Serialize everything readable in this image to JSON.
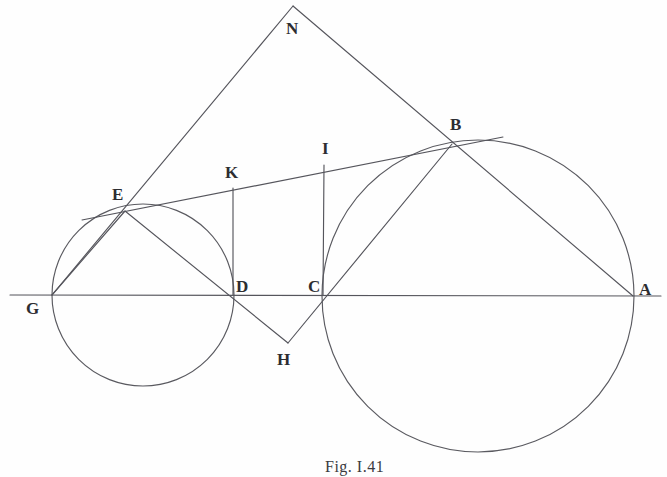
{
  "figure": {
    "caption": "Fig. I.41",
    "caption_position": {
      "x": 325,
      "y": 458
    },
    "background_color": "#fefefe",
    "line_color": "#55555c",
    "label_color": "#2d2d31",
    "width": 667,
    "height": 477
  },
  "points": [
    {
      "id": "N",
      "label": "N",
      "x": 293,
      "y": 6,
      "label_x": 286,
      "label_y": 20
    },
    {
      "id": "B",
      "label": "B",
      "x": 452,
      "y": 144,
      "label_x": 450,
      "label_y": 116
    },
    {
      "id": "I",
      "label": "I",
      "x": 324,
      "y": 165,
      "label_x": 322,
      "label_y": 140
    },
    {
      "id": "K",
      "label": "K",
      "x": 233,
      "y": 188,
      "label_x": 225,
      "label_y": 164
    },
    {
      "id": "E",
      "label": "E",
      "x": 125,
      "y": 211,
      "label_x": 112,
      "label_y": 186
    },
    {
      "id": "D",
      "label": "D",
      "x": 233,
      "y": 295,
      "label_x": 236,
      "label_y": 278
    },
    {
      "id": "C",
      "label": "C",
      "x": 323,
      "y": 295,
      "label_x": 308,
      "label_y": 278
    },
    {
      "id": "G",
      "label": "G",
      "x": 52,
      "y": 295,
      "label_x": 26,
      "label_y": 300
    },
    {
      "id": "A",
      "label": "A",
      "x": 633,
      "y": 296,
      "label_x": 639,
      "label_y": 281
    },
    {
      "id": "H",
      "label": "H",
      "x": 288,
      "y": 343,
      "label_x": 277,
      "label_y": 351
    }
  ],
  "circles": [
    {
      "id": "small-circle",
      "name": "circle-on-GD",
      "cx": 143,
      "cy": 295,
      "r": 91
    },
    {
      "id": "large-circle",
      "name": "circle-on-CA",
      "cx": 478,
      "cy": 296,
      "r": 156
    }
  ],
  "segments": [
    {
      "id": "baseline",
      "name": "baseline-G-A",
      "from": {
        "x": 10,
        "y": 295
      },
      "to": {
        "x": 661,
        "y": 296
      }
    },
    {
      "id": "G-N",
      "name": "line-G-E-N",
      "from": {
        "x": 52,
        "y": 295
      },
      "to": {
        "x": 293,
        "y": 6
      }
    },
    {
      "id": "N-A",
      "name": "line-N-B-A",
      "from": {
        "x": 293,
        "y": 6
      },
      "to": {
        "x": 633,
        "y": 296
      }
    },
    {
      "id": "tangent-E-B",
      "name": "tangent-line-E-K-I-B",
      "from": {
        "x": 82,
        "y": 220
      },
      "to": {
        "x": 503,
        "y": 137
      }
    },
    {
      "id": "E-H",
      "name": "line-E-D-H",
      "from": {
        "x": 125,
        "y": 211
      },
      "to": {
        "x": 288,
        "y": 343
      }
    },
    {
      "id": "H-B",
      "name": "line-H-C-B",
      "from": {
        "x": 288,
        "y": 343
      },
      "to": {
        "x": 452,
        "y": 144
      }
    },
    {
      "id": "G-E-chord",
      "name": "chord-G-E",
      "from": {
        "x": 52,
        "y": 295
      },
      "to": {
        "x": 125,
        "y": 211
      }
    },
    {
      "id": "D-K",
      "name": "perpendicular-D-K",
      "from": {
        "x": 233,
        "y": 295
      },
      "to": {
        "x": 233,
        "y": 188
      }
    },
    {
      "id": "C-I",
      "name": "perpendicular-C-I",
      "from": {
        "x": 323,
        "y": 295
      },
      "to": {
        "x": 324,
        "y": 165
      }
    }
  ]
}
